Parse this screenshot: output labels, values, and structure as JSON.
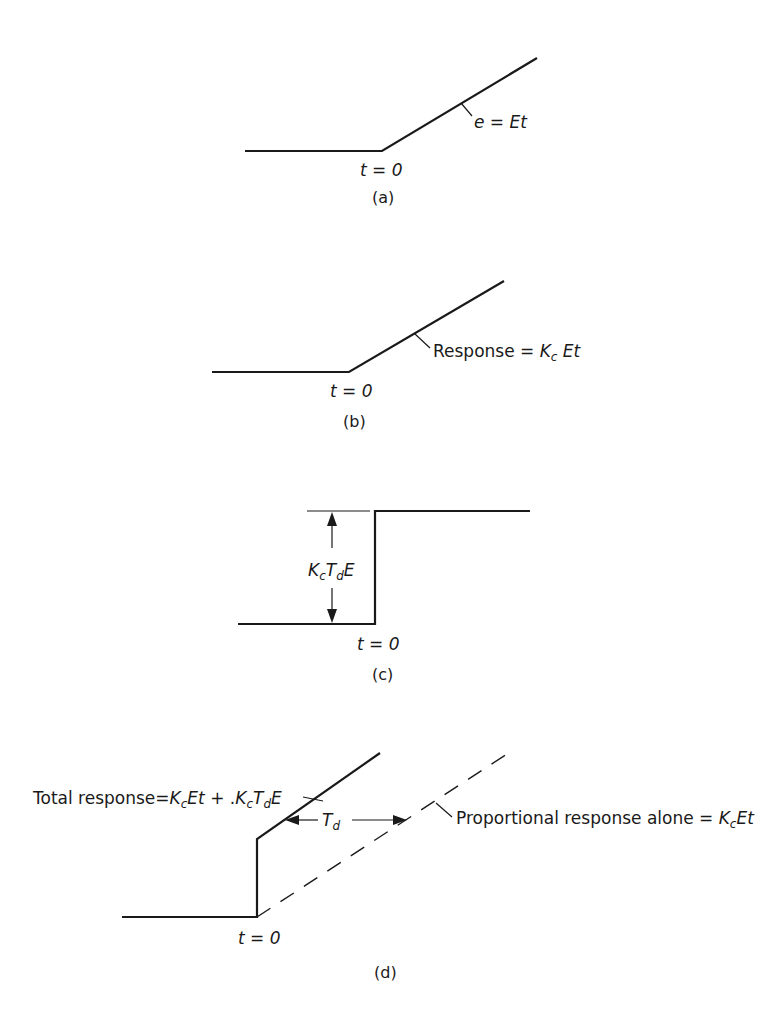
{
  "figure": {
    "panels": [
      {
        "id": "a",
        "caption": "(a)",
        "time_label": "t = 0",
        "curve_label": {
          "lhs": "e",
          "eq": " = ",
          "rhs": "Et"
        },
        "description": "Ramp error input beginning at t=0"
      },
      {
        "id": "b",
        "caption": "(b)",
        "time_label": "t = 0",
        "curve_label": {
          "prefix": "Response = ",
          "k": "K",
          "k_sub": "c",
          "rest": " Et"
        },
        "description": "Proportional response to ramp"
      },
      {
        "id": "c",
        "caption": "(c)",
        "time_label": "t = 0",
        "step_label": {
          "k": "K",
          "k_sub": "c",
          "t": "T",
          "t_sub": "d",
          "e": "E"
        },
        "description": "Derivative action step response of height Kc Td E"
      },
      {
        "id": "d",
        "caption": "(d)",
        "time_label": "t = 0",
        "total_label": {
          "prefix": "Total response=",
          "k1": "K",
          "k1_sub": "c",
          "t1": "Et",
          "plus": " + .",
          "k2": "K",
          "k2_sub": "c",
          "t2": "T",
          "t2_sub": "d",
          "e2": "E"
        },
        "lead_label": {
          "t": "T",
          "t_sub": "d"
        },
        "prop_label": {
          "prefix": "Proportional response alone = ",
          "k": "K",
          "k_sub": "c",
          "rest": "Et"
        },
        "description": "Total PD response leads proportional response by Td"
      }
    ]
  }
}
